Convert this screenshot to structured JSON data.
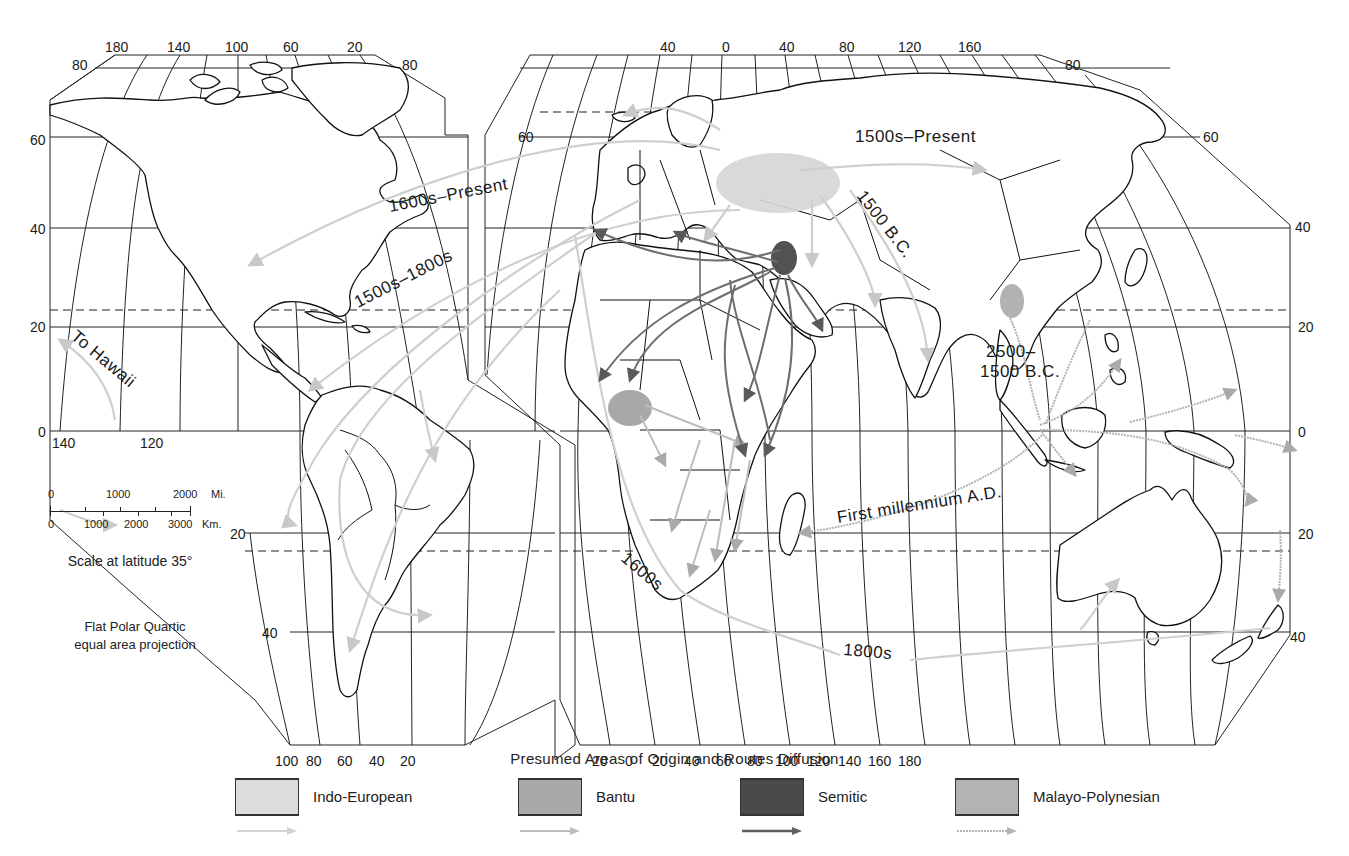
{
  "map": {
    "projection_note": [
      "Flat Polar Quartic",
      "equal area projection"
    ],
    "scale": {
      "caption": "Scale at latitude 35°",
      "miles": {
        "unit": "Mi.",
        "ticks": [
          "0",
          "1000",
          "2000"
        ]
      },
      "km": {
        "unit": "Km.",
        "ticks": [
          "0",
          "1000",
          "2000",
          "3000"
        ]
      }
    },
    "longitude_top_left": [
      "180",
      "140",
      "100",
      "60",
      "20"
    ],
    "longitude_top_right": [
      "40",
      "0",
      "40",
      "80",
      "120",
      "160"
    ],
    "longitude_bottom_left": [
      "100",
      "80",
      "60",
      "40",
      "20"
    ],
    "longitude_bottom_right": [
      "20",
      "0",
      "20",
      "40",
      "60",
      "80",
      "100",
      "120",
      "140",
      "160",
      "180"
    ],
    "longitude_equator_left": [
      "140",
      "120"
    ],
    "latitude_left": [
      "80",
      "60",
      "40",
      "20",
      "0",
      "20",
      "40"
    ],
    "latitude_right": [
      "80",
      "80",
      "60",
      "40",
      "20",
      "0",
      "20",
      "40"
    ],
    "route_labels": {
      "ie_east": "1500s–Present",
      "ie_na": "1600s–Present",
      "ie_la": "1500s–1800s",
      "ie_india": "1500 B.C.",
      "hawaii": "To Hawaii",
      "mp_date_a": "2500–",
      "mp_date_b": "1500 B.C.",
      "mp_madagascar": "First millennium A.D.",
      "ie_safrica": "1600s",
      "ie_australia": "1800s"
    }
  },
  "legend": {
    "title": "Presumed Areas of Origin and Routes Diffusion",
    "items": [
      {
        "name": "Indo-European",
        "fill": "#dcdcdc",
        "arrow": "#d3d3d3"
      },
      {
        "name": "Bantu",
        "fill": "#a9a9a9",
        "arrow": "#bdbdbd"
      },
      {
        "name": "Semitic",
        "fill": "#4a4a4a",
        "arrow": "#5e5e5e"
      },
      {
        "name": "Malayo-Polynesian",
        "fill": "#b3b3b3",
        "arrow": "#b3b3b3"
      }
    ]
  }
}
